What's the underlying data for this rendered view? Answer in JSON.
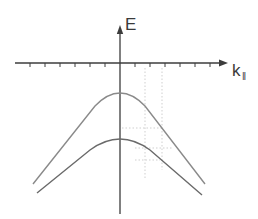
{
  "diagram": {
    "axes": {
      "y_label": "E",
      "x_label": "k",
      "x_label_subscript": "‖"
    },
    "colors": {
      "axis": "#3c3c3c",
      "band_upper": "#8a8a8a",
      "band_lower": "#6a6a6a",
      "guide": "#c8c8c8"
    },
    "bands": [
      {
        "name": "upper band",
        "peak": "near k = 0, below E = 0"
      },
      {
        "name": "lower band",
        "peak": "near k = 0, below upper band"
      }
    ]
  }
}
